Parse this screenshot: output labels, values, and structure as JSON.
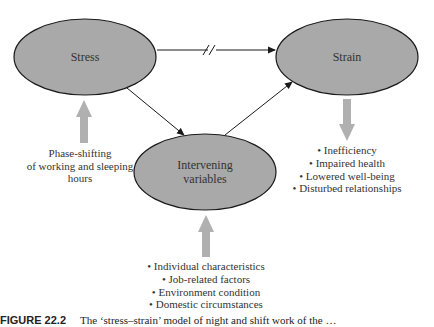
{
  "diagram": {
    "nodes": {
      "stress": {
        "label": "Stress"
      },
      "strain": {
        "label": "Strain"
      },
      "intervening": {
        "label_line1": "Intervening",
        "label_line2": "variables"
      }
    },
    "edges": [
      {
        "from": "stress",
        "to": "strain",
        "style": "line-with-break-mark"
      },
      {
        "from": "stress",
        "to": "intervening",
        "style": "arrow"
      },
      {
        "from": "intervening",
        "to": "strain",
        "style": "arrow"
      }
    ],
    "stress_input": {
      "lines": [
        "Phase-shifting",
        "of working and sleeping",
        "hours"
      ]
    },
    "strain_outcomes": {
      "items": [
        "Inefficiency",
        "Impaired health",
        "Lowered well-being",
        "Disturbed relationships"
      ]
    },
    "intervening_inputs": {
      "items": [
        "Individual characteristics",
        "Job-related factors",
        "Environment condition",
        "Domestic circumstances"
      ]
    },
    "bullet": "•",
    "colors": {
      "ellipse_fill": "#a9a9a9",
      "ellipse_stroke": "#1a1a1a",
      "block_arrow": "#b0b0b0",
      "line": "#1a1a1a"
    }
  },
  "caption": {
    "figure_number": "FIGURE 22.2",
    "text": "The ‘stress–strain’ model of night and shift work of the …"
  }
}
